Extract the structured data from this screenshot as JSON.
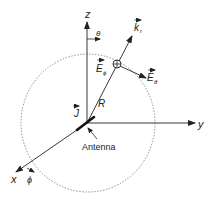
{
  "diagram": {
    "axes": {
      "z_label": "z",
      "y_label": "y",
      "x_label": "x"
    },
    "angles": {
      "theta": "θ",
      "phi": "ϕ"
    },
    "vectors": {
      "k_r": "k",
      "k_r_sub": "r",
      "E_phi": "E",
      "E_phi_sub": "ϕ",
      "E_theta": "E",
      "E_theta_sub": "θ",
      "J": "J"
    },
    "radius_label": "R",
    "antenna_label": "Antenna",
    "colors": {
      "line": "#222222",
      "dashed_sphere": "#777777",
      "background": "#ffffff"
    }
  }
}
